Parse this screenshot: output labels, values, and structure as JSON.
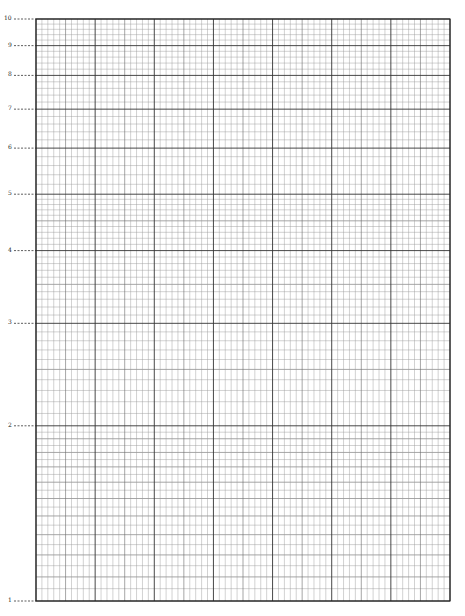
{
  "paper": {
    "type": "semi-log graph paper",
    "cycles": 1,
    "y_labels": [
      "1",
      "2",
      "3",
      "4",
      "5",
      "6",
      "7",
      "8",
      "9",
      "10"
    ],
    "y_values": [
      1,
      2,
      3,
      4,
      5,
      6,
      7,
      8,
      9,
      10
    ],
    "x_major_divisions": 7,
    "x_minor_per_major": 10,
    "line_color": "#333333",
    "minor_line_color": "#9a9a9a"
  }
}
